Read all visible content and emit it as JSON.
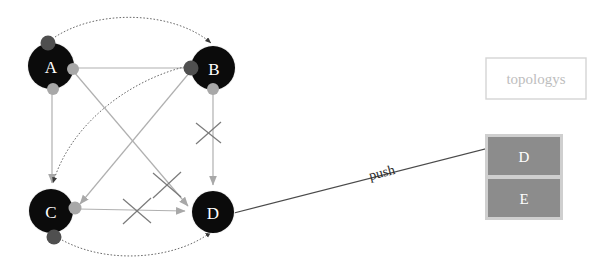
{
  "diagram": {
    "title_visible": false,
    "background": "#ffffff",
    "nodes": [
      {
        "id": "A",
        "label": "A",
        "cx": 51,
        "cy": 66,
        "r": 23,
        "fill": "#0b0b0b",
        "label_color": "#ffffff"
      },
      {
        "id": "B",
        "label": "B",
        "cx": 213,
        "cy": 68,
        "r": 22,
        "fill": "#0b0b0b",
        "label_color": "#ffffff"
      },
      {
        "id": "C",
        "label": "C",
        "cx": 51,
        "cy": 211,
        "r": 22,
        "fill": "#0b0b0b",
        "label_color": "#ffffff"
      },
      {
        "id": "D",
        "label": "D",
        "cx": 213,
        "cy": 212,
        "r": 21,
        "fill": "#0b0b0b",
        "label_color": "#ffffff"
      }
    ],
    "ports": [
      {
        "name": "port-a-top",
        "cx": 48,
        "cy": 43,
        "r": 7,
        "fill": "#4f4f4f"
      },
      {
        "name": "port-a-right",
        "cx": 73,
        "cy": 69,
        "r": 6,
        "fill": "#a8a8a8"
      },
      {
        "name": "port-a-bottom",
        "cx": 53,
        "cy": 89,
        "r": 6,
        "fill": "#a8a8a8"
      },
      {
        "name": "port-b-left",
        "cx": 191,
        "cy": 68,
        "r": 7,
        "fill": "#4f4f4f"
      },
      {
        "name": "port-b-bottom",
        "cx": 213,
        "cy": 89,
        "r": 6,
        "fill": "#a8a8a8"
      },
      {
        "name": "port-c-right",
        "cx": 73,
        "cy": 208,
        "r": 6,
        "fill": "#a8a8a8"
      },
      {
        "name": "port-c-bottom",
        "cx": 54,
        "cy": 236,
        "r": 7,
        "fill": "#4f4f4f"
      }
    ],
    "edges": [
      {
        "name": "edge-a-b-dotted",
        "from": "A",
        "to": "B",
        "style": "dotted",
        "color": "#5a5a5a",
        "arrow": true
      },
      {
        "name": "edge-a-b-solid",
        "from": "A",
        "to": "B",
        "style": "solid",
        "color": "#a8a8a8",
        "arrow": false
      },
      {
        "name": "edge-a-c",
        "from": "A",
        "to": "C",
        "style": "solid",
        "color": "#a8a8a8",
        "arrow": true
      },
      {
        "name": "edge-a-d",
        "from": "A",
        "to": "D",
        "style": "solid",
        "color": "#a8a8a8",
        "arrow": true
      },
      {
        "name": "edge-b-c",
        "from": "B",
        "to": "C",
        "style": "solid",
        "color": "#a8a8a8",
        "arrow": true
      },
      {
        "name": "edge-b-c-dotted",
        "from": "B",
        "to": "C",
        "style": "dotted",
        "color": "#5a5a5a",
        "arrow": true
      },
      {
        "name": "edge-b-d",
        "from": "B",
        "to": "D",
        "style": "solid",
        "color": "#a8a8a8",
        "arrow": true
      },
      {
        "name": "edge-c-d",
        "from": "C",
        "to": "D",
        "style": "solid",
        "color": "#a8a8a8",
        "arrow": true
      },
      {
        "name": "edge-c-d-dotted",
        "from": "C",
        "to": "D",
        "style": "dotted",
        "color": "#5a5a5a",
        "arrow": true
      }
    ],
    "cross_marks": [
      {
        "name": "cross-mark-b-d",
        "cx": 209,
        "cy": 133,
        "size": 13
      },
      {
        "name": "cross-mark-a-d",
        "cx": 167,
        "cy": 185,
        "size": 14
      },
      {
        "name": "cross-mark-c-d",
        "cx": 137,
        "cy": 211,
        "size": 14
      }
    ],
    "push_edge": {
      "name": "push-arrow",
      "label": "push",
      "from_x": 234,
      "from_y": 213,
      "to_x": 524,
      "to_y": 139,
      "color": "#4a4a4a",
      "label_x": 383,
      "label_y": 177
    }
  },
  "panels": {
    "topologys_box": {
      "label": "topologys",
      "x": 486,
      "y": 58,
      "width": 100,
      "height": 41,
      "border_color": "#d5d5d5",
      "fill": "#ffffff",
      "text_color": "#bdbdbd"
    },
    "stack_box": {
      "name": "stack-panel",
      "x": 487,
      "y": 136,
      "width": 74,
      "height": 82,
      "fill": "#8c8c8c",
      "border_color": "#cfcfcf",
      "cells": [
        {
          "label": "D",
          "name": "stack-cell-d"
        },
        {
          "label": "E",
          "name": "stack-cell-e"
        }
      ]
    }
  }
}
